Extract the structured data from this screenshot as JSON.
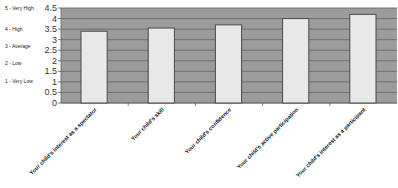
{
  "chart_data": {
    "type": "bar",
    "title": "",
    "xlabel": "",
    "ylabel": "",
    "ylim": [
      0,
      4.5
    ],
    "ytick_step": 0.5,
    "yticks": [
      "0",
      "0.5",
      "1",
      "1.5",
      "2",
      "2.5",
      "3",
      "3.5",
      "4",
      "4.5"
    ],
    "grid": true,
    "legend": "none",
    "rating_scale_labels": [
      {
        "label": "5 - Very High",
        "value": 4.5
      },
      {
        "label": "4 - High",
        "value": 3.5
      },
      {
        "label": "3 - Average",
        "value": 2.7
      },
      {
        "label": "2 - Low",
        "value": 1.9
      },
      {
        "label": "1 - Very Low",
        "value": 1.05
      }
    ],
    "categories": [
      "Your child's interest as a spectator",
      "Your child's skill",
      "Your child's confidence",
      "Your child's active participation",
      "Your child's interest as a participant"
    ],
    "values": [
      3.4,
      3.55,
      3.7,
      4.0,
      4.2
    ],
    "colors": {
      "plot_background": "#9c9c9c",
      "gridline": "#6a6a6a",
      "bar_fill": "#e8e8e8",
      "bar_border": "#4a4a4a"
    }
  }
}
